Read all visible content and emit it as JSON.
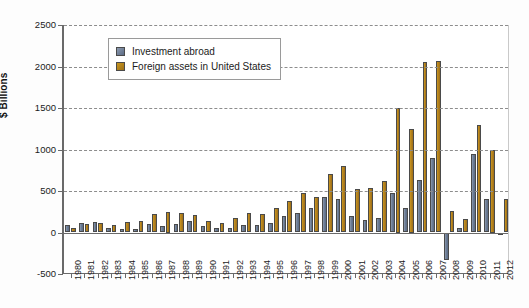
{
  "chart_data": {
    "type": "bar",
    "title": "",
    "subtitle": "",
    "xlabel": "",
    "ylabel": "$ Billions",
    "ylim": [
      -500,
      2500
    ],
    "yticks": [
      -500,
      0,
      500,
      1000,
      1500,
      2000,
      2500
    ],
    "ytick_labels": [
      "-500",
      "0",
      "500",
      "1000",
      "1500",
      "2000",
      "2500"
    ],
    "grid": true,
    "legend_position": "upper-left-inside",
    "categories": [
      "1980",
      "1981",
      "1982",
      "1983",
      "1984",
      "1985",
      "1986",
      "1987",
      "1988",
      "1989",
      "1990",
      "1991",
      "1992",
      "1993",
      "1994",
      "1995",
      "1996",
      "1997",
      "1998",
      "1999",
      "2000",
      "2001",
      "2002",
      "2003",
      "2004",
      "2005",
      "2006",
      "2007",
      "2008",
      "2009",
      "2010",
      "2011",
      "2012"
    ],
    "series": [
      {
        "name": "Investment abroad",
        "color": "#6b7c95",
        "values": [
          85,
          110,
          130,
          60,
          40,
          45,
          100,
          80,
          100,
          140,
          80,
          50,
          55,
          90,
          95,
          110,
          200,
          230,
          300,
          430,
          400,
          200,
          150,
          170,
          480,
          300,
          630,
          900,
          -330,
          60,
          940,
          400,
          -10
        ]
      },
      {
        "name": "Foreign assets in United States",
        "color": "#b5821f",
        "values": [
          60,
          100,
          110,
          85,
          130,
          140,
          220,
          250,
          230,
          210,
          140,
          110,
          170,
          230,
          220,
          300,
          380,
          480,
          430,
          700,
          800,
          520,
          540,
          620,
          1500,
          1250,
          2060,
          2070,
          260,
          160,
          1290,
          1000,
          400
        ]
      }
    ]
  },
  "legend": {
    "items": [
      {
        "label": "Investment abroad",
        "color": "#6b7c95"
      },
      {
        "label": "Foreign assets in United States",
        "color": "#b5821f"
      }
    ]
  },
  "axis": {
    "y_title": "$ Billions"
  }
}
